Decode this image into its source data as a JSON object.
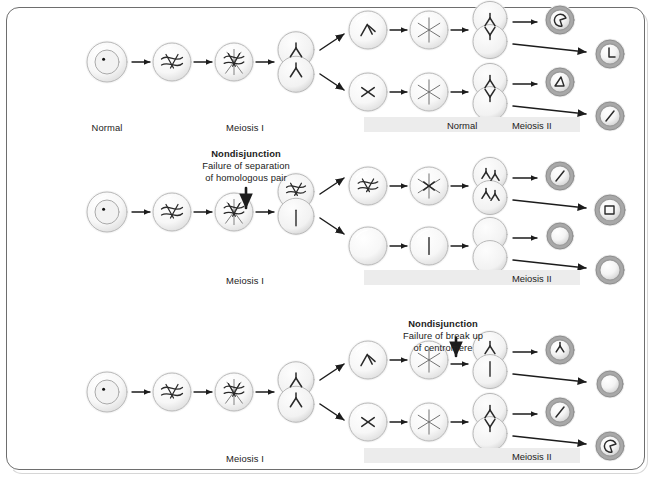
{
  "figure": {
    "frame_color": "#6e6e6e",
    "bar_color": "#ececec",
    "ink_color": "#2a2a2a"
  },
  "rows": [
    {
      "id": "row-normal",
      "phase_label_left": "Normal",
      "phase_label_meiosis1": "Meiosis I",
      "bar_labels": [
        "Normal",
        "Meiosis II"
      ],
      "nondisjunction": null
    },
    {
      "id": "row-nondisjunction-meiosis1",
      "phase_label_left": "",
      "phase_label_meiosis1": "Meiosis I",
      "bar_labels": [
        "Meiosis II"
      ],
      "nondisjunction": {
        "title": "Nondisjunction",
        "line1": "Failure of separation",
        "line2": "of homologous pair"
      }
    },
    {
      "id": "row-nondisjunction-meiosis2",
      "phase_label_left": "",
      "phase_label_meiosis1": "Meiosis I",
      "bar_labels": [
        "Meiosis II"
      ],
      "nondisjunction": {
        "title": "Nondisjunction",
        "line1": "Failure of break up",
        "line2": "of centromere"
      }
    }
  ],
  "labels": {
    "normal_left": "Normal",
    "meiosis_1": "Meiosis I",
    "meiosis_2": "Meiosis II",
    "normal_bar": "Normal",
    "nondisjunction": "Nondisjunction",
    "failure_separation": "Failure of separation",
    "homologous_pair": "of homologous pair",
    "failure_breakup": "Failure of break up",
    "centromere": "of centromere"
  },
  "icons": {
    "cell": "cell-circle-icon",
    "nucleus": "nucleus-icon",
    "chromosome": "chromosome-icon",
    "spindle": "spindle-fiber-icon",
    "dividing_cell": "dividing-cell-icon",
    "gamete": "gamete-icon",
    "empty_cell": "empty-cell-icon",
    "arrow": "arrow-right-icon",
    "down_arrow": "arrow-down-icon"
  }
}
